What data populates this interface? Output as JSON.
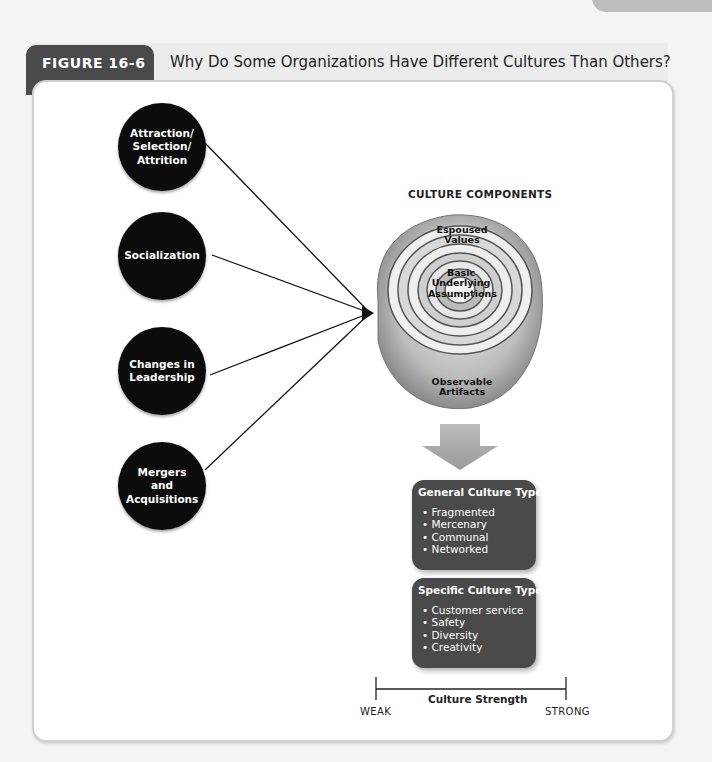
{
  "running_head": {
    "chapter": "CHAPTER 16",
    "section": "Organizational Culture"
  },
  "figure": {
    "label": "FIGURE 16-6",
    "title": "Why Do Some Organizations Have Different Cultures Than Others?"
  },
  "causes": [
    {
      "label": "Attraction/ Selection/ Attrition"
    },
    {
      "label": "Socialization"
    },
    {
      "label": "Changes in Leadership"
    },
    {
      "label": "Mergers and Acquisitions"
    }
  ],
  "culture_components": {
    "title": "CULTURE COMPONENTS",
    "layers": [
      {
        "label": "Espoused Values"
      },
      {
        "label": "Basic Underlying Assumptions"
      },
      {
        "label": "Observable Artifacts"
      }
    ]
  },
  "general_types": {
    "title": "General Culture Types",
    "items": [
      "Fragmented",
      "Mercenary",
      "Communal",
      "Networked"
    ]
  },
  "specific_types": {
    "title": "Specific Culture Types",
    "items": [
      "Customer service",
      "Safety",
      "Diversity",
      "Creativity"
    ]
  },
  "scale": {
    "title": "Culture Strength",
    "min_label": "WEAK",
    "max_label": "STRONG"
  },
  "colors": {
    "circle_fill": "#0c0c0c",
    "box_fill": "#4a4a4a",
    "figure_tab": "#4a4a4a",
    "arrow_fill": "#a8a8a8"
  }
}
